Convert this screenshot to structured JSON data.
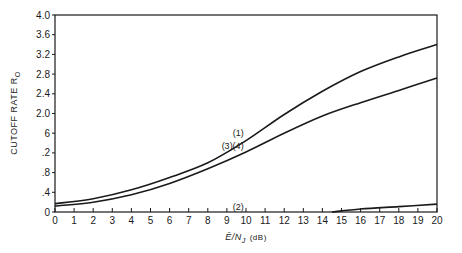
{
  "chart_data": {
    "type": "line",
    "title": "",
    "xlabel": "E/N_J (dB)",
    "xlabel_main": "Ē/N",
    "xlabel_sub": "J",
    "xlabel_unit": "(dB)",
    "ylabel": "CUTOFF RATE R0",
    "ylabel_main": "CUTOFF RATE R",
    "ylabel_sub": "O",
    "xlim": [
      0,
      20
    ],
    "ylim": [
      0,
      4.0
    ],
    "grid": false,
    "x_ticks": [
      0,
      1,
      2,
      3,
      4,
      5,
      6,
      7,
      8,
      9,
      10,
      11,
      12,
      13,
      14,
      15,
      16,
      17,
      18,
      19,
      20
    ],
    "x_tick_labels": [
      "0",
      "1",
      "2",
      "3",
      "4",
      "5",
      "6",
      "7",
      "8",
      "9",
      "10",
      "11",
      "12",
      "13",
      "14",
      "15",
      "16",
      "17",
      "18",
      "19",
      "20"
    ],
    "y_ticks": [
      0,
      0.4,
      0.8,
      1.2,
      1.6,
      2.0,
      2.4,
      2.8,
      3.2,
      3.6,
      4.0
    ],
    "y_tick_labels": [
      "0",
      ".4",
      ".8",
      ".2",
      "6",
      "2.0",
      "2.4",
      "2.8",
      "3.2",
      "3.6",
      "4.0"
    ],
    "x": [
      0,
      2,
      4,
      6,
      8,
      10,
      12,
      14,
      16,
      18,
      20
    ],
    "series": [
      {
        "name": "(1)",
        "values": [
          0.17,
          0.27,
          0.45,
          0.7,
          1.0,
          1.45,
          1.98,
          2.45,
          2.85,
          3.15,
          3.4
        ]
      },
      {
        "name": "(3)(4)",
        "values": [
          0.12,
          0.2,
          0.35,
          0.58,
          0.88,
          1.22,
          1.6,
          1.95,
          2.22,
          2.47,
          2.72
        ]
      },
      {
        "name": "(2)",
        "values": [
          0.0,
          0.0,
          0.0,
          0.0,
          0.0,
          0.0,
          0.0,
          0.0,
          0.06,
          0.11,
          0.16
        ]
      }
    ],
    "annotations": [
      {
        "text": "(1)",
        "x": 9.6,
        "y": 1.55
      },
      {
        "text": "(3)(4)",
        "x": 9.3,
        "y": 1.27
      },
      {
        "text": "(2)",
        "x": 9.6,
        "y": 0.05
      }
    ],
    "legend": "none (curve labels inline)"
  }
}
